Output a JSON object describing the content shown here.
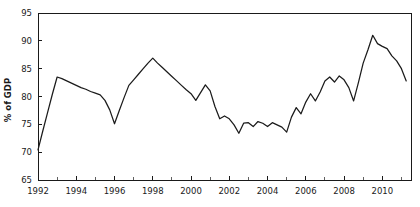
{
  "chart_data": {
    "type": "line",
    "title": "",
    "xlabel": "",
    "ylabel": "% of GDP",
    "xlim": [
      1992.0,
      2011.5
    ],
    "ylim": [
      65,
      95
    ],
    "grid": false,
    "legend": null,
    "y_ticks": [
      65,
      70,
      75,
      80,
      85,
      90,
      95
    ],
    "x_ticks_major": [
      1992,
      1994,
      1996,
      1998,
      2000,
      2002,
      2004,
      2006,
      2008,
      2010
    ],
    "x_tick_labels": [
      "1992",
      "1994",
      "1996",
      "1998",
      "2000",
      "2002",
      "2004",
      "2006",
      "2008",
      "2010"
    ],
    "x_ticks_minor": [
      1993,
      1995,
      1997,
      1999,
      2001,
      2003,
      2005,
      2007,
      2009,
      2011
    ],
    "line_color": "#1b1b1b",
    "series": [
      {
        "name": "Debt",
        "x": [
          1992.0,
          1992.25,
          1992.5,
          1992.75,
          1993.0,
          1993.25,
          1993.5,
          1993.75,
          1994.0,
          1994.25,
          1994.5,
          1994.75,
          1995.0,
          1995.25,
          1995.5,
          1995.75,
          1996.0,
          1996.25,
          1996.5,
          1996.75,
          1997.0,
          1997.25,
          1997.5,
          1997.75,
          1998.0,
          1998.25,
          1998.5,
          1998.75,
          1999.0,
          1999.25,
          1999.5,
          1999.75,
          2000.0,
          2000.25,
          2000.5,
          2000.75,
          2001.0,
          2001.25,
          2001.5,
          2001.75,
          2002.0,
          2002.25,
          2002.5,
          2002.75,
          2003.0,
          2003.25,
          2003.5,
          2003.75,
          2004.0,
          2004.25,
          2004.5,
          2004.75,
          2005.0,
          2005.25,
          2005.5,
          2005.75,
          2006.0,
          2006.25,
          2006.5,
          2006.75,
          2007.0,
          2007.25,
          2007.5,
          2007.75,
          2008.0,
          2008.25,
          2008.5,
          2008.75,
          2009.0,
          2009.25,
          2009.5,
          2009.75,
          2010.0,
          2010.25,
          2010.5,
          2010.75,
          2011.0,
          2011.25
        ],
        "values": [
          70.4,
          73.8,
          77.1,
          80.4,
          83.5,
          83.2,
          82.8,
          82.4,
          82.0,
          81.6,
          81.3,
          80.9,
          80.6,
          80.3,
          79.3,
          77.6,
          75.1,
          77.5,
          79.8,
          82.0,
          83.0,
          84.0,
          85.0,
          86.0,
          86.9,
          86.0,
          85.2,
          84.4,
          83.6,
          82.8,
          82.0,
          81.2,
          80.5,
          79.3,
          80.7,
          82.1,
          81.0,
          78.2,
          76.0,
          76.5,
          76.0,
          74.9,
          73.4,
          75.2,
          75.3,
          74.6,
          75.5,
          75.2,
          74.6,
          75.3,
          74.9,
          74.5,
          73.6,
          76.3,
          78.0,
          76.9,
          79.0,
          80.5,
          79.2,
          80.8,
          82.8,
          83.5,
          82.6,
          83.7,
          83.0,
          81.6,
          79.2,
          82.5,
          86.0,
          88.4,
          91.0,
          89.5,
          89.0,
          88.6,
          87.3,
          86.4,
          85.0,
          82.8
        ]
      }
    ]
  },
  "axis": {
    "ylabel": "% of GDP"
  }
}
